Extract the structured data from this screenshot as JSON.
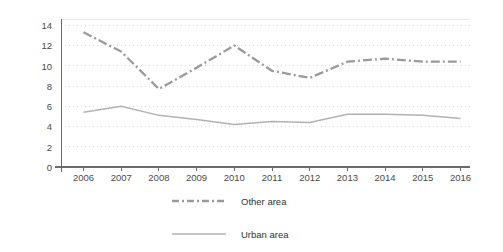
{
  "chart_data": {
    "type": "line",
    "title": "",
    "subtitle": "",
    "xlabel": "",
    "ylabel": "",
    "categories": [
      "2006",
      "2007",
      "2008",
      "2009",
      "2010",
      "2011",
      "2012",
      "2013",
      "2014",
      "2015",
      "2016"
    ],
    "x": [
      2006,
      2007,
      2008,
      2009,
      2010,
      2011,
      2012,
      2013,
      2014,
      2015,
      2016
    ],
    "series": [
      {
        "name": "Other area",
        "style": "dash-dot",
        "color": "#9a9a9a",
        "values": [
          13.3,
          11.4,
          7.7,
          9.8,
          12.0,
          9.5,
          8.8,
          10.4,
          10.7,
          10.4,
          10.4
        ]
      },
      {
        "name": "Urban area",
        "style": "solid",
        "color": "#b2b2b2",
        "values": [
          5.4,
          6.0,
          5.1,
          4.7,
          4.2,
          4.5,
          4.4,
          5.2,
          5.2,
          5.1,
          4.8
        ]
      }
    ],
    "ylim": [
      0,
      15
    ],
    "yticks": [
      0,
      2,
      4,
      6,
      8,
      10,
      12,
      14
    ],
    "ytick_labels": [
      "0",
      "2",
      "4",
      "6",
      "8",
      "10",
      "12",
      "14"
    ],
    "grid": true,
    "grid_axis": "y",
    "legend_position": "bottom-center",
    "legend": [
      {
        "label": "Other area",
        "marker": "dash-dot-line"
      },
      {
        "label": "Urban area",
        "marker": "solid-line"
      }
    ]
  },
  "colors": {
    "background": "#ffffff",
    "axis": "#6b6b6b",
    "grid": "#c8c8c8",
    "other_area": "#9a9a9a",
    "urban_area": "#b2b2b2",
    "tick_text": "#4a4a4a",
    "legend_text": "#333333"
  }
}
